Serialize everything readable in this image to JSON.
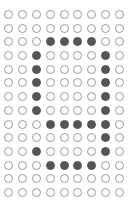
{
  "grid": {
    "rows": 14,
    "cols": 9,
    "colors": {
      "on": "#555555",
      "off_border": "#9a9a9a",
      "off_fill": "#ffffff"
    },
    "cells": [
      [
        0,
        0,
        0,
        0,
        0,
        0,
        0,
        0,
        0
      ],
      [
        0,
        0,
        0,
        0,
        0,
        0,
        0,
        0,
        0
      ],
      [
        0,
        0,
        0,
        1,
        1,
        1,
        1,
        0,
        0
      ],
      [
        0,
        0,
        1,
        0,
        0,
        0,
        0,
        1,
        0
      ],
      [
        0,
        0,
        1,
        0,
        0,
        0,
        0,
        1,
        0
      ],
      [
        0,
        0,
        1,
        0,
        0,
        0,
        0,
        1,
        0
      ],
      [
        0,
        0,
        1,
        0,
        0,
        0,
        0,
        1,
        0
      ],
      [
        0,
        0,
        1,
        0,
        0,
        0,
        0,
        1,
        0
      ],
      [
        0,
        0,
        0,
        1,
        1,
        1,
        1,
        1,
        0
      ],
      [
        0,
        0,
        0,
        0,
        0,
        0,
        0,
        1,
        0
      ],
      [
        0,
        0,
        1,
        0,
        0,
        0,
        0,
        1,
        0
      ],
      [
        0,
        0,
        0,
        1,
        1,
        1,
        1,
        0,
        0
      ],
      [
        0,
        0,
        0,
        0,
        0,
        0,
        0,
        0,
        0
      ],
      [
        0,
        0,
        0,
        0,
        0,
        0,
        0,
        0,
        0
      ]
    ]
  }
}
